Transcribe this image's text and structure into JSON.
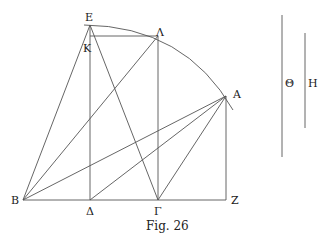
{
  "caption": "Fig. 26",
  "points": {
    "E": {
      "label": "E",
      "x": 90,
      "y": 25
    },
    "K": {
      "label": "K",
      "x": 90,
      "y": 36
    },
    "L": {
      "label": "Λ",
      "x": 158,
      "y": 36
    },
    "A": {
      "label": "A",
      "x": 226,
      "y": 96
    },
    "B": {
      "label": "B",
      "x": 23,
      "y": 200
    },
    "D": {
      "label": "Δ",
      "x": 90,
      "y": 200
    },
    "G": {
      "label": "Γ",
      "x": 158,
      "y": 200
    },
    "Z": {
      "label": "Z",
      "x": 226,
      "y": 200
    }
  },
  "segments": {
    "theta": {
      "label": "Θ"
    },
    "eta": {
      "label": "H"
    }
  }
}
